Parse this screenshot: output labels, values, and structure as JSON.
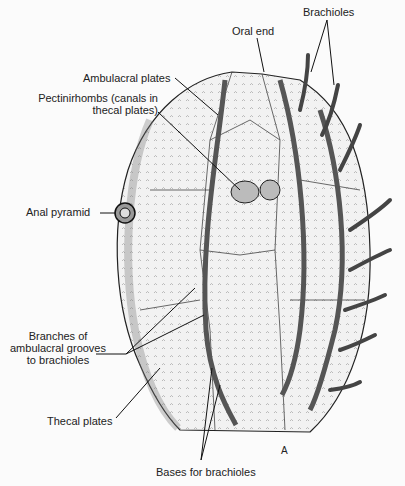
{
  "figure": {
    "letter": "A"
  },
  "labels": {
    "brachioles": "Brachioles",
    "oral_end": "Oral end",
    "ambulacral_plates": "Ambulacral plates",
    "pectinirhombs_line1": "Pectinirhombs (canals in",
    "pectinirhombs_line2": "thecal plates)",
    "anal_pyramid": "Anal pyramid",
    "branches_line1": "Branches of",
    "branches_line2": "ambulacral grooves",
    "branches_line3": "to brachioles",
    "thecal_plates": "Thecal plates",
    "bases_for_brachioles": "Bases for brachioles"
  }
}
